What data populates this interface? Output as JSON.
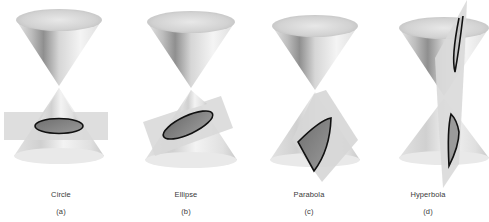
{
  "figures": [
    {
      "name": "Circle",
      "label": "(a)"
    },
    {
      "name": "Ellipse",
      "label": "(b)"
    },
    {
      "name": "Parabola",
      "label": "(c)"
    },
    {
      "name": "Hyperbola",
      "label": "(d)"
    }
  ],
  "colors": {
    "background": "#ffffff",
    "cone_light": "#f2f2f2",
    "cone_mid": "#c8c8c8",
    "cone_dark": "#8a8a8a",
    "plane": "#d9d9d9",
    "section_fill": "#7a7a7a",
    "section_outline": "#111111",
    "caption_text": "#3a3a3a"
  }
}
